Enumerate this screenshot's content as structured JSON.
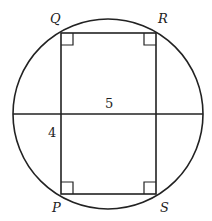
{
  "diagram": {
    "labels": {
      "Q": "Q",
      "R": "R",
      "P": "P",
      "S": "S"
    },
    "measurements": {
      "horizontal": "5",
      "vertical": "4"
    },
    "colors": {
      "stroke": "#222222",
      "background": "#ffffff"
    }
  }
}
